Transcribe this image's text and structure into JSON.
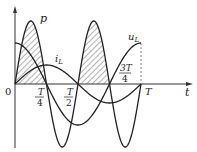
{
  "diagram": {
    "axes": {
      "x_label": "t",
      "origin_label": "0",
      "ticks": [
        {
          "num": "T",
          "den": "4"
        },
        {
          "num": "T",
          "den": "2"
        },
        {
          "num": "3T",
          "den": "4"
        },
        {
          "full": "T"
        }
      ]
    },
    "curves": [
      {
        "name": "p",
        "label": "p",
        "description": "instantaneous power, frequency 2x, shaded positive lobes"
      },
      {
        "name": "i_L",
        "label": "i",
        "sub": "L",
        "description": "inductor current, sine"
      },
      {
        "name": "u_L",
        "label": "u",
        "sub": "L",
        "description": "inductor voltage, cosine (leads current by 90°)"
      }
    ],
    "colors": {
      "stroke": "#222222",
      "hatch": "#555555",
      "dashed": "#888888"
    }
  },
  "chart_data": {
    "type": "line",
    "title": "",
    "xlabel": "t",
    "ylabel": "",
    "x": [
      0,
      0.125,
      0.25,
      0.375,
      0.5,
      0.625,
      0.75,
      0.875,
      1.0
    ],
    "x_ticks": [
      "0",
      "T/4",
      "T/2",
      "3T/4",
      "T"
    ],
    "series": [
      {
        "name": "u_L",
        "values": [
          1,
          0.707,
          0,
          -0.707,
          -1,
          -0.707,
          0,
          0.707,
          1
        ]
      },
      {
        "name": "i_L",
        "values": [
          0,
          0.707,
          1,
          0.707,
          0,
          -0.707,
          -1,
          -0.707,
          0
        ]
      },
      {
        "name": "p",
        "values": [
          0,
          1,
          0,
          -1,
          0,
          1,
          0,
          -1,
          0
        ]
      }
    ],
    "annotations": [
      "shaded regions where p > 0 (0–T/4 and T/2–3T/4)",
      "dashed vertical line at t = T"
    ]
  }
}
